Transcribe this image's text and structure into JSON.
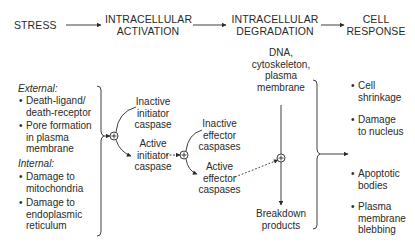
{
  "header": {
    "stages": [
      {
        "label": "STRESS"
      },
      {
        "label_line1": "INTRACELLULAR",
        "label_line2": "ACTIVATION"
      },
      {
        "label_line1": "INTRACELLULAR",
        "label_line2": "DEGRADATION"
      },
      {
        "label_line1": "CELL",
        "label_line2": "RESPONSE"
      }
    ]
  },
  "stress": {
    "external_label": "External:",
    "external_items": [
      {
        "line1": "Death-ligand/",
        "line2": "death-receptor"
      },
      {
        "line1": "Pore formation",
        "line2": "in plasma",
        "line3": "membrane"
      }
    ],
    "internal_label": "Internal:",
    "internal_items": [
      {
        "line1": "Damage to",
        "line2": "mitochondria"
      },
      {
        "line1": "Damage to",
        "line2": "endoplasmic",
        "line3": "reticulum"
      }
    ]
  },
  "activation": {
    "inactive_initiator": {
      "line1": "Inactive",
      "line2": "initiator",
      "line3": "caspase"
    },
    "active_initiator": {
      "line1": "Active",
      "line2": "initiator",
      "line3": "caspase"
    },
    "inactive_effector": {
      "line1": "Inactive",
      "line2": "effector",
      "line3": "caspases"
    },
    "active_effector": {
      "line1": "Active",
      "line2": "effector",
      "line3": "caspases"
    }
  },
  "degradation": {
    "targets": {
      "line1": "DNA,",
      "line2": "cytoskeleton,",
      "line3": "plasma",
      "line4": "membrane"
    },
    "products": {
      "line1": "Breakdown",
      "line2": "products"
    }
  },
  "response": {
    "bullet": "•",
    "items": [
      {
        "line1": "Cell",
        "line2": "shrinkage"
      },
      {
        "line1": "Damage",
        "line2": "to nucleus"
      },
      {
        "line1": "Apoptotic",
        "line2": "bodies"
      },
      {
        "line1": "Plasma",
        "line2": "membrane",
        "line3": "blebbing"
      }
    ]
  },
  "symbols": {
    "combine": "+"
  }
}
